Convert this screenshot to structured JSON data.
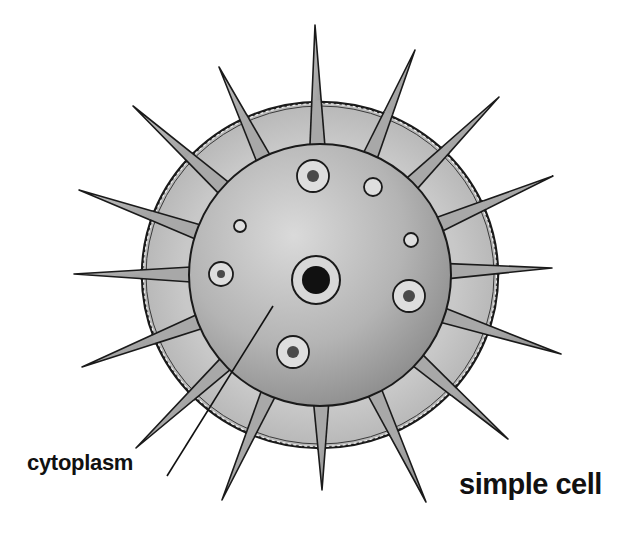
{
  "diagram": {
    "title": "simple cell",
    "labels": [
      {
        "id": "cytoplasm",
        "text": "cytoplasm",
        "pointer_from": [
          167,
          476
        ],
        "pointer_to": [
          273,
          306
        ]
      }
    ],
    "colors": {
      "background": "#ffffff",
      "outline": "#1a1a1a",
      "outer_layer": "#bdbdbd",
      "inner_sphere_light": "#d6d6d6",
      "inner_sphere_dark": "#8e8e8e",
      "spike_fill": "#a6a6a6",
      "organelle_ring": "#dcdcdc",
      "organelle_core": "#4a4a4a",
      "nucleus_core": "#111111"
    },
    "cell": {
      "center": [
        320,
        275
      ],
      "outer_membrane": {
        "rx": 178,
        "ry": 173
      },
      "inner_sphere": {
        "rx": 131,
        "ry": 131
      }
    },
    "spike_tips": [
      [
        315,
        25
      ],
      [
        415,
        50
      ],
      [
        499,
        97
      ],
      [
        553,
        176
      ],
      [
        552,
        268
      ],
      [
        561,
        354
      ],
      [
        508,
        439
      ],
      [
        426,
        502
      ],
      [
        322,
        490
      ],
      [
        222,
        500
      ],
      [
        136,
        448
      ],
      [
        82,
        367
      ],
      [
        74,
        274
      ],
      [
        79,
        190
      ],
      [
        133,
        106
      ],
      [
        219,
        67
      ]
    ],
    "nucleus": {
      "cx": 316,
      "cy": 280,
      "r_outer": 24,
      "r_core": 14
    },
    "organelles": [
      {
        "cx": 313,
        "cy": 176,
        "r": 16,
        "core": 6
      },
      {
        "cx": 373,
        "cy": 187,
        "r": 9,
        "core": 0
      },
      {
        "cx": 240,
        "cy": 226,
        "r": 6,
        "core": 0
      },
      {
        "cx": 411,
        "cy": 240,
        "r": 7,
        "core": 0
      },
      {
        "cx": 221,
        "cy": 274,
        "r": 12,
        "core": 4
      },
      {
        "cx": 409,
        "cy": 296,
        "r": 16,
        "core": 6
      },
      {
        "cx": 293,
        "cy": 352,
        "r": 16,
        "core": 6
      }
    ]
  }
}
